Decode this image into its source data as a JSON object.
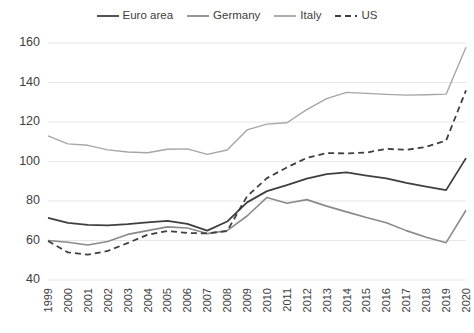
{
  "chart_data": {
    "type": "line",
    "title": "",
    "subtitle": "",
    "xlabel": "",
    "ylabel": "",
    "xlim": [
      1999,
      2020
    ],
    "ylim": [
      40,
      160
    ],
    "yticks": [
      40,
      60,
      80,
      100,
      120,
      140,
      160
    ],
    "grid": true,
    "legend_position": "top-center",
    "x": [
      1999,
      2000,
      2001,
      2002,
      2003,
      2004,
      2005,
      2006,
      2007,
      2008,
      2009,
      2010,
      2011,
      2012,
      2013,
      2014,
      2015,
      2016,
      2017,
      2018,
      2019,
      2020
    ],
    "categories": [
      "1999",
      "2000",
      "2001",
      "2002",
      "2003",
      "2004",
      "2005",
      "2006",
      "2007",
      "2008",
      "2009",
      "2010",
      "2011",
      "2012",
      "2013",
      "2014",
      "2015",
      "2016",
      "2017",
      "2018",
      "2019",
      "2020"
    ],
    "series": [
      {
        "name": "Euro area",
        "color": "#3f3f3f",
        "width": 1.8,
        "dash": "none",
        "values": [
          71.4,
          68.9,
          67.9,
          67.7,
          68.3,
          69.2,
          69.9,
          68.4,
          65.0,
          69.6,
          79.3,
          85.0,
          88.0,
          91.3,
          93.6,
          94.5,
          92.9,
          91.4,
          89.2,
          87.3,
          85.5,
          101.7
        ]
      },
      {
        "name": "Germany",
        "color": "#8a8a8a",
        "width": 1.6,
        "dash": "none",
        "values": [
          60.0,
          59.1,
          57.7,
          59.5,
          63.1,
          65.0,
          66.9,
          66.3,
          63.5,
          65.0,
          72.4,
          81.8,
          78.9,
          80.7,
          77.4,
          74.5,
          71.6,
          69.0,
          65.0,
          61.6,
          58.9,
          75.3
        ]
      },
      {
        "name": "Italy",
        "color": "#a6a6a6",
        "width": 1.4,
        "dash": "none",
        "values": [
          113.0,
          108.9,
          108.2,
          105.9,
          104.8,
          104.4,
          106.2,
          106.4,
          103.6,
          105.8,
          116.0,
          118.9,
          119.6,
          126.3,
          131.8,
          135.0,
          134.5,
          134.0,
          133.6,
          133.8,
          134.1,
          157.8
        ]
      },
      {
        "name": "US",
        "color": "#3f3f3f",
        "width": 1.8,
        "dash": "6 4",
        "values": [
          59.7,
          54.0,
          52.8,
          54.7,
          58.7,
          62.9,
          64.8,
          63.8,
          63.6,
          64.8,
          82.4,
          91.6,
          97.0,
          101.8,
          104.3,
          104.1,
          104.5,
          106.4,
          105.9,
          107.4,
          110.6,
          136.0
        ]
      }
    ],
    "legend": [
      {
        "label": "Euro area",
        "color": "#3f3f3f",
        "dash": "none"
      },
      {
        "label": "Germany",
        "color": "#8a8a8a",
        "dash": "none"
      },
      {
        "label": "Italy",
        "color": "#a6a6a6",
        "dash": "none"
      },
      {
        "label": "US",
        "color": "#3f3f3f",
        "dash": "6 4"
      }
    ]
  }
}
